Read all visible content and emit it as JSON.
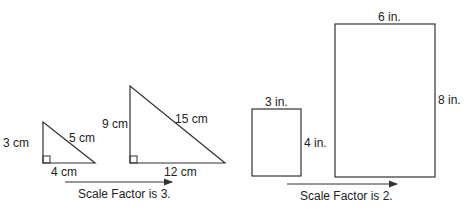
{
  "figure": {
    "left_example": {
      "small_triangle": {
        "vertical_leg": "3 cm",
        "horizontal_leg": "4 cm",
        "hypotenuse": "5 cm"
      },
      "large_triangle": {
        "vertical_leg": "9 cm",
        "horizontal_leg": "12 cm",
        "hypotenuse": "15 cm"
      },
      "caption": "Scale Factor is 3."
    },
    "right_example": {
      "small_rectangle": {
        "width": "3 in.",
        "height": "4 in."
      },
      "large_rectangle": {
        "width": "6 in.",
        "height": "8 in."
      },
      "caption": "Scale Factor is 2."
    },
    "colors": {
      "stroke": "#333333",
      "background": "#ffffff"
    }
  }
}
